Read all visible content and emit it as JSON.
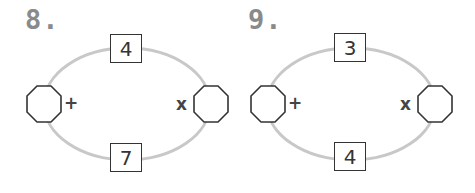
{
  "puzzles": [
    {
      "label": "8.",
      "top_box": "4",
      "bottom_box": "7",
      "left_operator": "+",
      "right_operator": "x",
      "left_answer": "",
      "right_answer": ""
    },
    {
      "label": "9.",
      "top_box": "3",
      "bottom_box": "4",
      "left_operator": "+",
      "right_operator": "x",
      "left_answer": "",
      "right_answer": ""
    }
  ],
  "colors": {
    "ring": "#c8c8c8",
    "outline": "#333333",
    "label": "#8a8a8a"
  }
}
